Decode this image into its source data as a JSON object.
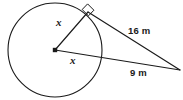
{
  "figure": {
    "kind": "geometry-diagram",
    "width": 183,
    "height": 100,
    "background_color": "#ffffff",
    "stroke_color": "#1a1a1a",
    "label_color": "#1a1a1a"
  },
  "shapes": {
    "circle": {
      "name": "circle",
      "center_x": 55,
      "center_y": 50,
      "radius": 47
    },
    "center_point": {
      "name": "center-dot",
      "x": 55,
      "y": 50,
      "size": 4
    },
    "tangent_point": {
      "name": "tangent-point",
      "x": 88,
      "y": 12
    },
    "external_point": {
      "name": "external-vertex",
      "x": 180,
      "y": 70
    },
    "secant_circle_intersection": {
      "name": "secant-exit-point",
      "x": 101,
      "y": 57
    },
    "right_angle_marker": {
      "name": "right-angle-square",
      "at_x": 88,
      "at_y": 12,
      "size": 8
    }
  },
  "segments": [
    {
      "name": "radius-to-tangent-point",
      "from": "center",
      "to": "tangent-point",
      "label": "x"
    },
    {
      "name": "radius-along-secant",
      "from": "center",
      "to": "external-vertex",
      "label": "x"
    },
    {
      "name": "tangent-segment",
      "from": "tangent-point",
      "to": "external-vertex",
      "label": "16 m"
    },
    {
      "name": "external-secant-segment",
      "from": "circle-edge",
      "to": "external-vertex",
      "label": "9 m"
    }
  ],
  "labels": {
    "x_radius": "x",
    "x_secant": "x",
    "tangent_length": "16 m",
    "external_segment_length": "9 m"
  }
}
